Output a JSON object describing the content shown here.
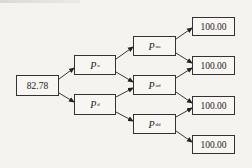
{
  "diagram": {
    "type": "binomial-tree",
    "root": {
      "id": "root",
      "value": "82.78"
    },
    "level1": [
      {
        "id": "pu",
        "symbol": "P",
        "subscript": "u"
      },
      {
        "id": "pd",
        "symbol": "P",
        "subscript": "d"
      }
    ],
    "level2": [
      {
        "id": "puu",
        "symbol": "P",
        "subscript": "uu"
      },
      {
        "id": "pud",
        "symbol": "P",
        "subscript": "ud"
      },
      {
        "id": "pdd",
        "symbol": "P",
        "subscript": "dd"
      }
    ],
    "leaves": [
      {
        "id": "leaf1",
        "value": "100.00"
      },
      {
        "id": "leaf2",
        "value": "100.00"
      },
      {
        "id": "leaf3",
        "value": "100.00"
      },
      {
        "id": "leaf4",
        "value": "100.00"
      }
    ],
    "edges": [
      [
        "root",
        "pu"
      ],
      [
        "root",
        "pd"
      ],
      [
        "pu",
        "puu"
      ],
      [
        "pu",
        "pud"
      ],
      [
        "pd",
        "pud"
      ],
      [
        "pd",
        "pdd"
      ],
      [
        "puu",
        "leaf1"
      ],
      [
        "puu",
        "leaf2"
      ],
      [
        "pud",
        "leaf2"
      ],
      [
        "pud",
        "leaf3"
      ],
      [
        "pdd",
        "leaf3"
      ],
      [
        "pdd",
        "leaf4"
      ]
    ],
    "colors": {
      "line": "#222222",
      "box_border": "#333333",
      "background": "#f4f3ef"
    }
  }
}
